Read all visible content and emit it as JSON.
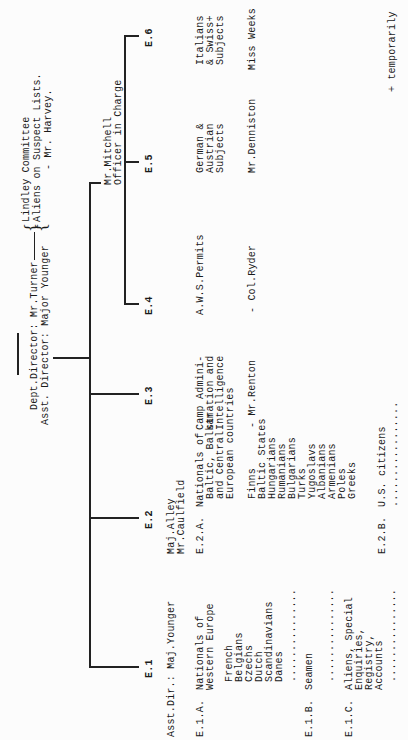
{
  "document": {
    "director": {
      "line1": "Dept.Director: Mr.Turner",
      "line2": "Asst. Director: Major Younger"
    },
    "lindley": {
      "line1": "Lindley Committee",
      "line2": "Aliens on Suspect Lists.",
      "line3": "- Mr. Harvey."
    },
    "mitchell": {
      "line1": "Mr.Mitchell",
      "line2": "Officer in Charge"
    },
    "sections": [
      {
        "id": "E.1",
        "head": "Asst.Dir.: Maj.Younger"
      },
      {
        "id": "E.2",
        "head1": "Maj.Alley",
        "head2": "Mr.Caulfield"
      },
      {
        "id": "E.3",
        "desc1": "Camp Admini-",
        "desc2": "stration and",
        "desc3": "Intelligence",
        "person": "- Mr.Renton"
      },
      {
        "id": "E.4",
        "desc1": "A.W.S.Permits",
        "person": "- Col.Ryder"
      },
      {
        "id": "E.5",
        "desc1": "German &",
        "desc2": "Austrian",
        "desc3": "Subjects",
        "person": "Mr.Denniston"
      },
      {
        "id": "E.6",
        "desc1": "Italians",
        "desc2": "& Swiss+",
        "desc3": "Subjects",
        "person": "Miss Weeks"
      }
    ],
    "e1": {
      "a_code": "E.1.A.",
      "a_title1": "Nationals of",
      "a_title2": "Western Europe",
      "a_items": [
        "French",
        "Belgians",
        "Czechs",
        "Dutch",
        "Scandinavians",
        "Danes"
      ],
      "b_code": "E.1.B.",
      "b_title": "Seamen",
      "c_code": "E.1.C.",
      "c_title1": "Aliens, Special",
      "c_title2": "Enquiries,",
      "c_title3": "Registry,",
      "c_title4": "Accounts",
      "dots": "..............."
    },
    "e2": {
      "a_code": "E.2.A.",
      "a_title1": "Nationals of",
      "a_title2": "Baltic, Balkan",
      "a_title3": "and Central",
      "a_title4": "European countries",
      "a_items": [
        "Finns",
        "Baltic States",
        "Hungarians",
        "Rumanians",
        "Bulgarians",
        "Turks",
        "Yugoslavs",
        "Albanians",
        "Armenians",
        "Poles",
        "Greeks"
      ],
      "b_code": "E.2.B.",
      "b_title": "U.S. citizens",
      "dots": "................."
    },
    "footnote": "+ temporarily"
  }
}
